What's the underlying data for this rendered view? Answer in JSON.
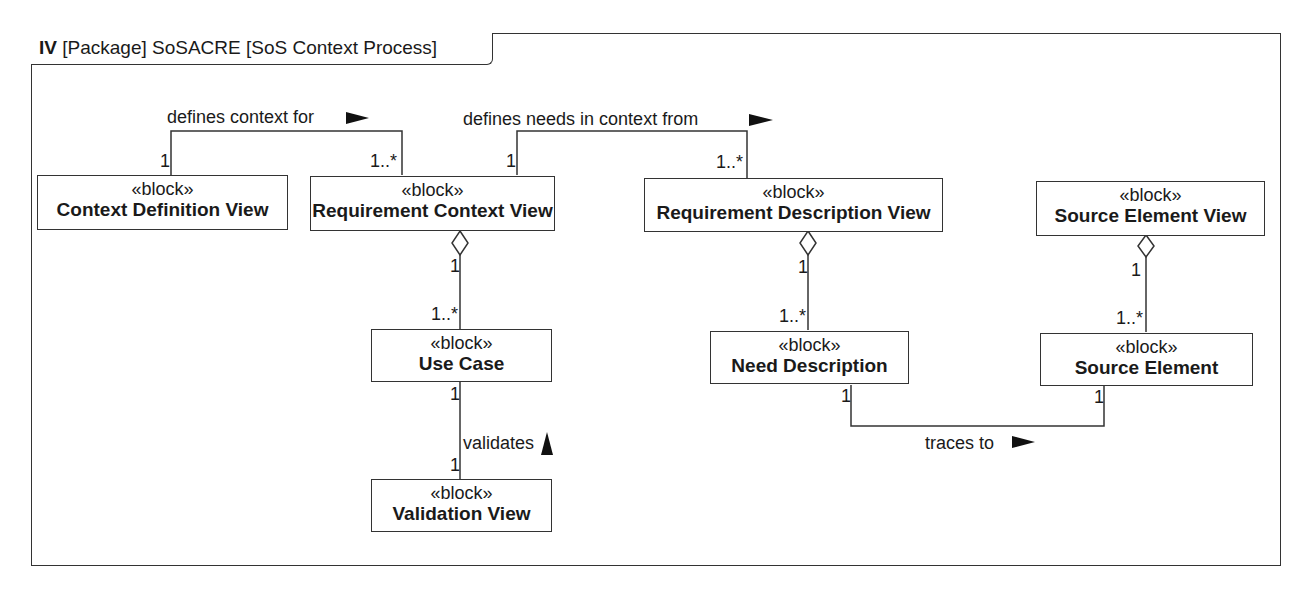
{
  "frame": {
    "kind": "IV",
    "title": "[Package] SoSACRE [SoS Context Process]"
  },
  "blocks": {
    "context_definition_view": {
      "stereotype": "«block»",
      "name": "Context Definition View"
    },
    "requirement_context_view": {
      "stereotype": "«block»",
      "name": "Requirement Context View"
    },
    "requirement_description_view": {
      "stereotype": "«block»",
      "name": "Requirement Description View"
    },
    "source_element_view": {
      "stereotype": "«block»",
      "name": "Source Element View"
    },
    "use_case": {
      "stereotype": "«block»",
      "name": "Use Case"
    },
    "need_description": {
      "stereotype": "«block»",
      "name": "Need Description"
    },
    "source_element": {
      "stereotype": "«block»",
      "name": "Source Element"
    },
    "validation_view": {
      "stereotype": "«block»",
      "name": "Validation View"
    }
  },
  "associations": {
    "defines_context_for": {
      "label": "defines context for",
      "direction": "right",
      "source_mult": "1",
      "target_mult": "1..*"
    },
    "defines_needs": {
      "label": "defines needs in context from",
      "direction": "right",
      "source_mult": "1",
      "target_mult": "1..*"
    },
    "rcv_usecase": {
      "type": "aggregation",
      "whole_mult": "1",
      "part_mult": "1..*"
    },
    "rdv_need": {
      "type": "aggregation",
      "whole_mult": "1",
      "part_mult": "1..*"
    },
    "sev_source": {
      "type": "aggregation",
      "whole_mult": "1",
      "part_mult": "1..*"
    },
    "validates": {
      "label": "validates",
      "direction": "up",
      "source_mult": "1",
      "target_mult": "1"
    },
    "traces_to": {
      "label": "traces to",
      "direction": "right",
      "source_mult": "1",
      "target_mult": "1"
    }
  },
  "colors": {
    "line": "#333333",
    "text": "#1a1a1a",
    "background": "#ffffff"
  }
}
